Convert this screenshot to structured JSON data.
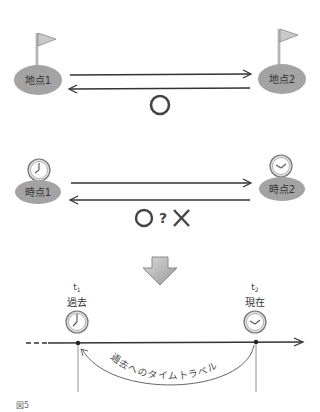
{
  "section1": {
    "point1_label": "地点1",
    "point2_label": "地点2",
    "verdict": "〇",
    "icon": "flag-icon"
  },
  "section2": {
    "point1_label": "時点1",
    "point2_label": "時点2",
    "verdict_circle": "〇",
    "verdict_question": "?",
    "verdict_cross": "✕",
    "icon": "clock-icon"
  },
  "transition": {
    "icon": "down-arrow-icon"
  },
  "section3": {
    "t1_symbol": "t",
    "t1_sub": "1",
    "t1_label": "過去",
    "t2_symbol": "t",
    "t2_sub": "2",
    "t2_label": "現在",
    "arc_label": "過去へのタイムトラベル"
  },
  "caption": "図5",
  "colors": {
    "ellipse": "#a3a3a3",
    "line": "#333333",
    "arrow_fill": "#b8b8b8"
  }
}
